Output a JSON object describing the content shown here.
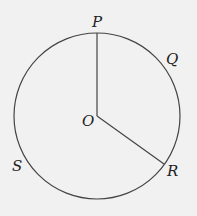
{
  "diagram": {
    "type": "circle-with-radii",
    "center": {
      "label": "O",
      "x": 97,
      "y": 116
    },
    "radius": 83,
    "points": [
      {
        "label": "P",
        "x": 97,
        "y": 33
      },
      {
        "label": "Q",
        "x": 170,
        "y": 62
      },
      {
        "label": "R",
        "x": 164,
        "y": 164
      },
      {
        "label": "S",
        "x": 18,
        "y": 165
      }
    ],
    "segments": [
      {
        "from": "O",
        "to": "P"
      },
      {
        "from": "O",
        "to": "R"
      }
    ],
    "colors": {
      "stroke": "#444444",
      "background": "#f1f1f1",
      "text": "#222222"
    }
  }
}
